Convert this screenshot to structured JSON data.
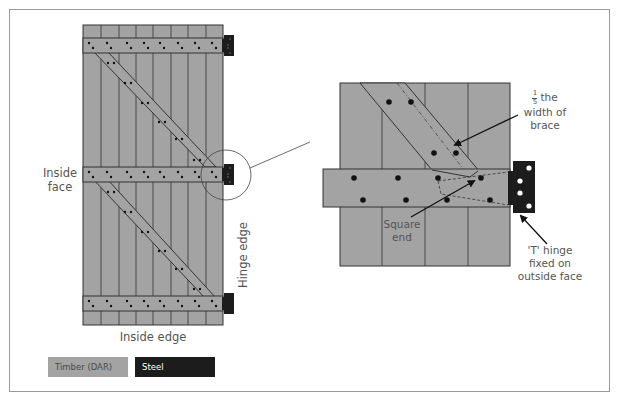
{
  "labels": {
    "inside_face": [
      "Inside",
      "face"
    ],
    "hinge_edge": "Hinge edge",
    "inside_edge": "Inside edge",
    "fraction": {
      "numerator": "1",
      "denominator": "5"
    },
    "brace_note": [
      "the",
      "width of",
      "brace"
    ],
    "square_end": [
      "Square",
      "end"
    ],
    "t_hinge": [
      "'T' hinge",
      "fixed on",
      "outside face"
    ]
  },
  "legend": [
    {
      "label": "Timber (DAR)",
      "color": "#a3a3a3",
      "text_color": "#4a4a4a"
    },
    {
      "label": "Steel",
      "color": "#1c1c1c",
      "text_color": "#ffffff"
    }
  ],
  "colors": {
    "timber": "#a3a3a3",
    "steel": "#1c1c1c",
    "outline": "#333333",
    "frame_border": "#9a9a9a"
  }
}
